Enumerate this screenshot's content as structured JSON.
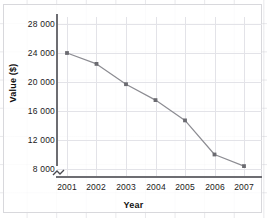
{
  "chart_data": {
    "type": "line",
    "title": "",
    "xlabel": "Year",
    "ylabel": "Value ($)",
    "categories": [
      "2001",
      "2002",
      "2003",
      "2004",
      "2005",
      "2006",
      "2007"
    ],
    "x": [
      2001,
      2002,
      2003,
      2004,
      2005,
      2006,
      2007
    ],
    "values": [
      24000,
      22500,
      19700,
      17500,
      14700,
      10000,
      8400
    ],
    "series": [
      {
        "name": "Value",
        "values": [
          24000,
          22500,
          19700,
          17500,
          14700,
          10000,
          8400
        ]
      }
    ],
    "ylim": [
      8000,
      28000
    ],
    "yticks": [
      8000,
      12000,
      16000,
      20000,
      24000,
      28000
    ],
    "ytick_labels": [
      "8 000",
      "12 000",
      "16 000",
      "20 000",
      "24 000",
      "28 000"
    ],
    "xticks": [
      2001,
      2002,
      2003,
      2004,
      2005,
      2006,
      2007
    ],
    "xtick_labels": [
      "2001",
      "2002",
      "2003",
      "2004",
      "2005",
      "2006",
      "2007"
    ],
    "grid": true,
    "legend": false,
    "legend_position": "none",
    "axis_break": true,
    "marker": "square",
    "line_color": "#8c8c92",
    "marker_color": "#6b6b71",
    "grid_color": "#e3e3e8",
    "axis_color": "#6d6d72",
    "background_color": "#ffffff"
  },
  "annotations": {
    "axis_break_note": "break-symbol on y-axis below 8 000"
  }
}
